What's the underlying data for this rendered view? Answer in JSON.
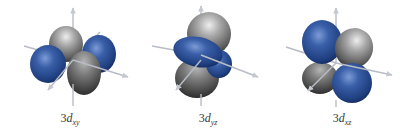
{
  "figure": {
    "colors": {
      "phase_positive": "#2b4f95",
      "phase_positive_highlight": "#6f8fcf",
      "phase_positive_shadow": "#14285a",
      "phase_negative": "#8a8a8a",
      "phase_negative_highlight": "#e2e2e2",
      "phase_negative_shadow": "#3c3c3c",
      "axis": "#b8bcc4",
      "background": "#ffffff"
    },
    "orbitals": [
      {
        "id": "dxy",
        "label_prefix": "3",
        "label_main": "d",
        "label_subscript": "xy",
        "lobes": [
          "gray-top-back",
          "blue-left",
          "blue-right",
          "gray-front-bottom"
        ]
      },
      {
        "id": "dyz",
        "label_prefix": "3",
        "label_main": "d",
        "label_subscript": "yz",
        "lobes": [
          "gray-top",
          "blue-front-left",
          "blue-back-right",
          "gray-bottom"
        ]
      },
      {
        "id": "dxz",
        "label_prefix": "3",
        "label_main": "d",
        "label_subscript": "xz",
        "lobes": [
          "blue-top-left",
          "gray-top-right",
          "gray-bottom-left",
          "blue-bottom-right"
        ]
      }
    ]
  }
}
